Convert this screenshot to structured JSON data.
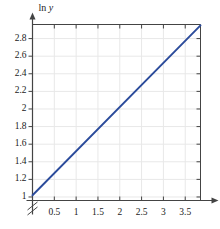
{
  "chart_data": {
    "type": "line",
    "title": "",
    "xlabel": "t",
    "ylabel": "ln y",
    "xlim": [
      0,
      3.85
    ],
    "ylim": [
      0.96,
      2.96
    ],
    "grid": true,
    "legend": null,
    "axis_break": {
      "axis": "y",
      "symbol": "double-slash",
      "below_value": 1.0
    },
    "xticks": [
      0.5,
      1,
      1.5,
      2,
      2.5,
      3,
      3.5
    ],
    "xtick_labels": [
      "0.5",
      "1",
      "1.5",
      "2",
      "2.5",
      "3",
      "3.5"
    ],
    "yticks": [
      1,
      1.2,
      1.4,
      1.6,
      1.8,
      2,
      2.2,
      2.4,
      2.6,
      2.8
    ],
    "ytick_labels": [
      "1",
      "1.2",
      "1.4",
      "1.6",
      "1.8",
      "2",
      "2.2",
      "2.4",
      "2.6",
      "2.8"
    ],
    "series": [
      {
        "name": "ln y vs t",
        "color": "#2B4B9B",
        "x": [
          0,
          3.85
        ],
        "y": [
          1.02,
          2.95
        ],
        "slope": 0.5013,
        "intercept": 1.02
      }
    ],
    "colors": {
      "line": "#2B4B9B",
      "axis": "#444444",
      "grid": "#E8E8E8",
      "text": "#1a1a1a",
      "background": "#ffffff"
    }
  }
}
